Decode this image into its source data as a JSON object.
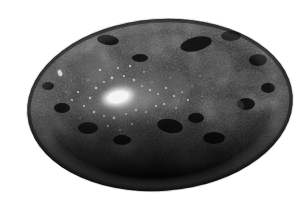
{
  "image": {
    "domain": "Natural-Image",
    "subject_label": "polished dark granite pebble",
    "description": "A single smooth ovoid dark grey-black speckled stone photographed on a plain white background, lit from the upper left producing a bright specular highlight.",
    "background_color": "#ffffff",
    "width": 308,
    "height": 204,
    "color_mode": "grayscale"
  },
  "stone": {
    "name": "pebble",
    "shape": "ellipse",
    "center_x": 160,
    "center_y": 105,
    "radius_x": 133,
    "radius_y": 86,
    "rotation_deg": -4,
    "base_color": "#2e2e2e",
    "mid_tone_color": "#3c3c3c",
    "shadow_color": "#050505",
    "rim_color": "#171717",
    "texture": "mottled granular speckle"
  },
  "highlight": {
    "name": "specular-highlight",
    "center_x": 118,
    "center_y": 97,
    "core_radius_x": 16,
    "core_radius_y": 9,
    "glow_radius_x": 62,
    "glow_radius_y": 34,
    "core_color": "#ffffff",
    "glow_color": "#b4b4b4",
    "rotation_deg": -12
  },
  "sparkle": {
    "name": "mineral-sparkle-field",
    "center_x": 140,
    "center_y": 100,
    "spread_x": 95,
    "spread_y": 48,
    "count": 260,
    "color": "#e8e8e8"
  },
  "speck": {
    "name": "bright-fleck",
    "x": 60,
    "y": 73,
    "radius": 2,
    "color": "#d8d8d8"
  },
  "lighting": {
    "direction": "upper-left",
    "shadow_band_start_y": 140,
    "shadow_band_end_y": 192
  }
}
